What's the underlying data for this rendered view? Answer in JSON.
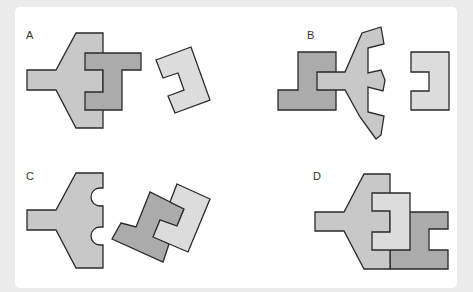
{
  "panels": [
    {
      "label": "A",
      "description": "Plane-shaped piece with a dark E-shaped piece overlapping, separate light C-shaped piece rotated"
    },
    {
      "label": "B",
      "description": "Dark L-shaped piece behind plane-shaped piece with notched arms, separate light C-shaped piece"
    },
    {
      "label": "C",
      "description": "Plane-shaped piece with two semicircular notches, separate interlocked dark and light pieces rotated"
    },
    {
      "label": "D",
      "description": "Plane-shaped piece combined with light E piece and dark H-like piece forming assembled figure"
    }
  ],
  "colors": {
    "background": "#ececec",
    "card": "#ffffff",
    "shape_mid": "#c8c8c8",
    "shape_dark": "#ababab",
    "shape_light": "#dcdcdc",
    "outline": "#2a2a2a"
  }
}
